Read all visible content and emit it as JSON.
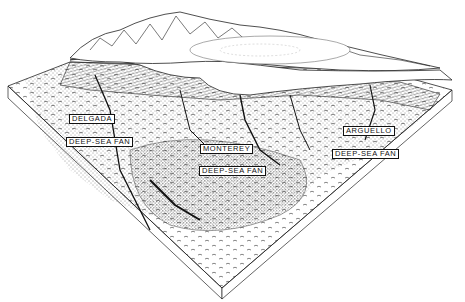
{
  "diagram": {
    "type": "block-diagram",
    "style": "black-and-white stippled pen illustration",
    "colors": {
      "ink": "#111111",
      "paper": "#ffffff"
    }
  },
  "labels": [
    {
      "id": "delgada",
      "text": "DELGADA",
      "x": 69,
      "y": 114
    },
    {
      "id": "delgada-fan",
      "text": "DEEP-SEA FAN",
      "x": 66,
      "y": 137
    },
    {
      "id": "monterey",
      "text": "MONTEREY",
      "x": 200,
      "y": 144
    },
    {
      "id": "monterey-fan",
      "text": "DEEP-SEA FAN",
      "x": 199,
      "y": 166
    },
    {
      "id": "arguello",
      "text": "ARGUELLO",
      "x": 343,
      "y": 126
    },
    {
      "id": "arguello-fan",
      "text": "DEEP-SEA FAN",
      "x": 332,
      "y": 149
    }
  ]
}
